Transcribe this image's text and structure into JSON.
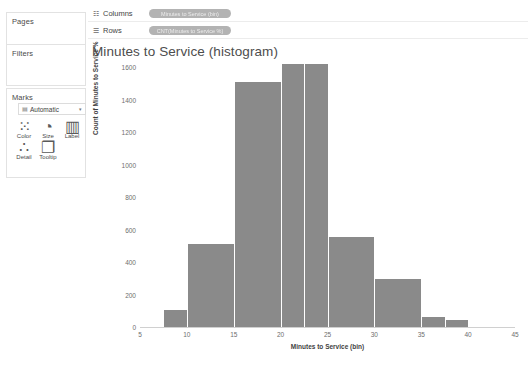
{
  "left_panel": {
    "pages_label": "Pages",
    "filters_label": "Filters",
    "marks_label": "Marks",
    "marks_type": {
      "icon": "marks-type-icon",
      "value": "Automatic",
      "caret": "▾"
    },
    "cards": [
      {
        "name": "color",
        "label": "Color",
        "glyph": "⁙"
      },
      {
        "name": "size",
        "label": "Size",
        "glyph": "◔"
      },
      {
        "name": "label",
        "label": "Label",
        "glyph": "▥"
      },
      {
        "name": "detail",
        "label": "Detail",
        "glyph": "∴"
      },
      {
        "name": "tooltip",
        "label": "Tooltip",
        "glyph": "❐"
      }
    ]
  },
  "shelves": [
    {
      "name": "columns",
      "icon": "☷",
      "label": "Columns",
      "pill": "Minutes to Service (bin)"
    },
    {
      "name": "rows",
      "icon": "☰",
      "label": "Rows",
      "pill": "CNT(Minutes to Service %)"
    }
  ],
  "chart_data": {
    "type": "bar",
    "title": "Minutes to Service (histogram)",
    "xlabel": "Minutes to Service (bin)",
    "ylabel": "Count of Minutes to Service %",
    "xlim": [
      5,
      45
    ],
    "ylim": [
      0,
      1600
    ],
    "grid": false,
    "legend": null,
    "bar_color": "#8a8a8a",
    "xticks": [
      5,
      10,
      15,
      20,
      25,
      30,
      35,
      40,
      45
    ],
    "yticks": [
      0,
      200,
      400,
      600,
      800,
      1000,
      1200,
      1400,
      1600
    ],
    "bins": [
      {
        "x0": 7.5,
        "x1": 10.0,
        "value": 105
      },
      {
        "x0": 10.0,
        "x1": 15.0,
        "value": 510
      },
      {
        "x0": 15.0,
        "x1": 20.0,
        "value": 1505
      },
      {
        "x0": 20.0,
        "x1": 22.5,
        "value": 1620
      },
      {
        "x0": 22.5,
        "x1": 25.0,
        "value": 1620
      },
      {
        "x0": 25.0,
        "x1": 30.0,
        "value": 555
      },
      {
        "x0": 30.0,
        "x1": 35.0,
        "value": 293
      },
      {
        "x0": 35.0,
        "x1": 37.5,
        "value": 62
      },
      {
        "x0": 37.5,
        "x1": 40.0,
        "value": 45
      }
    ]
  }
}
